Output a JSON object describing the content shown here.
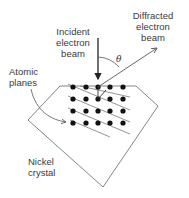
{
  "diagram": {
    "labels": {
      "incident_line1": "Incident",
      "incident_line2": "electron",
      "incident_line3": "beam",
      "diffracted_line1": "Diffracted",
      "diffracted_line2": "electron",
      "diffracted_line3": "beam",
      "atomic_line1": "Atomic",
      "atomic_line2": "planes",
      "nickel_line1": "Nickel",
      "nickel_line2": "crystal",
      "angle": "θ"
    },
    "lattice": {
      "rows": 4,
      "columns": 5
    },
    "colors": {
      "line": "#555555",
      "dot": "#111111",
      "text": "#3a3a3a"
    }
  }
}
